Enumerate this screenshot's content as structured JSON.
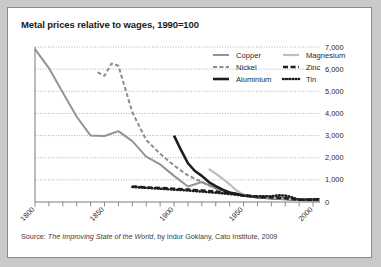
{
  "panel": {
    "title": "Metal prices relative to wages, 1990=100",
    "source_prefix": "Source: ",
    "source_italic": "The Improving State of the World",
    "source_suffix": ", by Indur Goklany, Cato Institute, 2009",
    "background": "#c9c9c7",
    "panel_background": "#ffffff",
    "border_color": "#8a8a88"
  },
  "chart_data": {
    "type": "line",
    "title": "Metal prices relative to wages, 1990=100",
    "xlabel": "",
    "ylabel": "",
    "xlim": [
      1800,
      2005
    ],
    "ylim": [
      0,
      7000
    ],
    "grid": true,
    "grid_style": "dotted-horizontal",
    "legend_position": "top-right",
    "xticks": [
      1800,
      1850,
      1900,
      1950,
      2000
    ],
    "xtick_labels": [
      "1800",
      "1850",
      "1900",
      "1950",
      "2000"
    ],
    "xminor_step": 10,
    "yticks": [
      0,
      1000,
      2000,
      3000,
      4000,
      5000,
      6000,
      7000
    ],
    "ytick_labels": [
      "0",
      "1,000",
      "2,000",
      "3,000",
      "4,000",
      "5,000",
      "6,000",
      "7,000"
    ],
    "series": [
      {
        "name": "Copper",
        "color": "#949494",
        "style": "solid",
        "width": 2.0,
        "x": [
          1800,
          1810,
          1820,
          1830,
          1840,
          1850,
          1860,
          1870,
          1880,
          1890,
          1900,
          1910,
          1920,
          1930,
          1940,
          1950,
          1960,
          1970,
          1980,
          1990,
          2000,
          2005
        ],
        "y": [
          6900,
          6050,
          4950,
          3850,
          3000,
          2980,
          3200,
          2750,
          2050,
          1700,
          1180,
          700,
          900,
          620,
          430,
          300,
          210,
          190,
          150,
          100,
          105,
          115
        ]
      },
      {
        "name": "Nickel",
        "color": "#8c8c8c",
        "style": "dashed",
        "width": 2.0,
        "x": [
          1845,
          1850,
          1855,
          1860,
          1870,
          1880,
          1890,
          1900,
          1910,
          1920,
          1930,
          1940,
          1950,
          1960,
          1970,
          1980,
          1990,
          2000,
          2005
        ],
        "y": [
          5850,
          5700,
          6250,
          6150,
          4050,
          2800,
          2180,
          1650,
          1200,
          900,
          620,
          400,
          290,
          230,
          200,
          170,
          100,
          110,
          130
        ]
      },
      {
        "name": "Aluminium",
        "color": "#1d1d1d",
        "style": "solid",
        "width": 2.6,
        "x": [
          1900,
          1905,
          1910,
          1915,
          1920,
          1925,
          1930,
          1935,
          1940,
          1950,
          1960,
          1970,
          1980,
          1990,
          2000,
          2005
        ],
        "y": [
          3000,
          2350,
          1750,
          1400,
          1180,
          900,
          720,
          560,
          430,
          300,
          215,
          175,
          140,
          100,
          95,
          95
        ]
      },
      {
        "name": "Magnesium",
        "color": "#bdbdbd",
        "style": "solid",
        "width": 2.2,
        "x": [
          1925,
          1930,
          1935,
          1940,
          1945,
          1950,
          1960,
          1970,
          1980,
          1990,
          2000,
          2005
        ],
        "y": [
          1500,
          1280,
          1050,
          800,
          520,
          330,
          230,
          180,
          140,
          100,
          98,
          100
        ]
      },
      {
        "name": "Zinc",
        "color": "#1d1d1d",
        "style": "dashed",
        "width": 2.6,
        "x": [
          1870,
          1880,
          1890,
          1900,
          1910,
          1920,
          1930,
          1940,
          1950,
          1960,
          1970,
          1980,
          1990,
          2000,
          2005
        ],
        "y": [
          700,
          660,
          630,
          600,
          560,
          520,
          470,
          400,
          300,
          240,
          210,
          170,
          100,
          110,
          120
        ]
      },
      {
        "name": "Tin",
        "color": "#1d1d1d",
        "style": "dotted",
        "width": 2.6,
        "x": [
          1870,
          1880,
          1890,
          1900,
          1910,
          1920,
          1930,
          1940,
          1950,
          1960,
          1970,
          1975,
          1980,
          1985,
          1990,
          2000,
          2005
        ],
        "y": [
          680,
          640,
          600,
          560,
          520,
          470,
          420,
          360,
          290,
          250,
          260,
          300,
          290,
          210,
          100,
          105,
          110
        ]
      }
    ]
  },
  "legend": {
    "column_left": [
      {
        "label": "Copper",
        "key": "copper"
      },
      {
        "label": "Nickel",
        "key": "nickel"
      },
      {
        "label": "Aluminium",
        "key": "aluminium"
      }
    ],
    "column_right": [
      {
        "label": "Magnesium",
        "key": "magnesium"
      },
      {
        "label": "Zinc",
        "key": "zinc"
      },
      {
        "label": "Tin",
        "key": "tin"
      }
    ]
  }
}
